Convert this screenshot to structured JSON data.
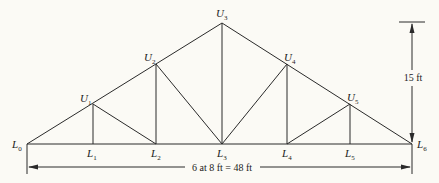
{
  "diagram": {
    "type": "truss",
    "nodes": {
      "lower": [
        {
          "id": "L0",
          "letter": "L",
          "sub": "0",
          "x": 27,
          "y": 144
        },
        {
          "id": "L1",
          "letter": "L",
          "sub": "1",
          "x": 93,
          "y": 144
        },
        {
          "id": "L2",
          "letter": "L",
          "sub": "2",
          "x": 156,
          "y": 144
        },
        {
          "id": "L3",
          "letter": "L",
          "sub": "3",
          "x": 222,
          "y": 144
        },
        {
          "id": "L4",
          "letter": "L",
          "sub": "4",
          "x": 287,
          "y": 144
        },
        {
          "id": "L5",
          "letter": "L",
          "sub": "5",
          "x": 350,
          "y": 144
        },
        {
          "id": "L6",
          "letter": "L",
          "sub": "6",
          "x": 412,
          "y": 144
        }
      ],
      "upper": [
        {
          "id": "U1",
          "letter": "U",
          "sub": "1",
          "x": 93,
          "y": 104
        },
        {
          "id": "U2",
          "letter": "U",
          "sub": "2",
          "x": 156,
          "y": 64
        },
        {
          "id": "U3",
          "letter": "U",
          "sub": "3",
          "x": 222,
          "y": 23
        },
        {
          "id": "U4",
          "letter": "U",
          "sub": "4",
          "x": 287,
          "y": 64
        },
        {
          "id": "U5",
          "letter": "U",
          "sub": "5",
          "x": 350,
          "y": 104
        }
      ]
    },
    "members": [
      [
        "L0",
        "L6"
      ],
      [
        "L0",
        "U3"
      ],
      [
        "U3",
        "L6"
      ],
      [
        "U1",
        "L1"
      ],
      [
        "U2",
        "L2"
      ],
      [
        "U3",
        "L3"
      ],
      [
        "U4",
        "L4"
      ],
      [
        "U5",
        "L5"
      ],
      [
        "U1",
        "L2"
      ],
      [
        "U2",
        "L3"
      ],
      [
        "U4",
        "L3"
      ],
      [
        "U5",
        "L4"
      ]
    ],
    "dimensions": {
      "span_label": "6 at 8 ft = 48 ft",
      "height_label": "15 ft"
    },
    "colors": {
      "line": "#2a2a2a",
      "background": "#fbfaf5"
    }
  }
}
